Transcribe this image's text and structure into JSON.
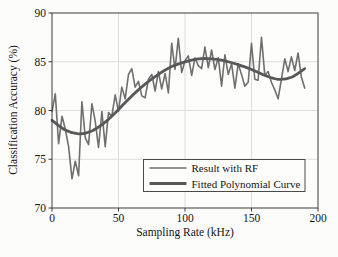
{
  "chart_data": {
    "type": "line",
    "title": "",
    "xlabel": "Sampling Rate (kHz)",
    "ylabel": "Classification Accuracy (%)",
    "xlim": [
      0,
      200
    ],
    "ylim": [
      70,
      90
    ],
    "x_ticks": [
      0,
      50,
      100,
      150,
      200
    ],
    "y_ticks": [
      70,
      75,
      80,
      85,
      90
    ],
    "grid": true,
    "legend_position": "inside lower right",
    "series": [
      {
        "name": "Result with RF",
        "color": "#6f6f6f",
        "stroke_width": 1.6,
        "smooth": false,
        "x": [
          0,
          2.5,
          5,
          7.5,
          10,
          12.5,
          15,
          17.5,
          20,
          22.5,
          25,
          27.5,
          30,
          32.5,
          35,
          37.5,
          40,
          42.5,
          45,
          47.5,
          50,
          52.5,
          55,
          57.5,
          60,
          62.5,
          65,
          67.5,
          70,
          72.5,
          75,
          77.5,
          80,
          82.5,
          85,
          87.5,
          90,
          92.5,
          95,
          97.5,
          100,
          102.5,
          105,
          107.5,
          110,
          112.5,
          115,
          117.5,
          120,
          122.5,
          125,
          127.5,
          130,
          132.5,
          135,
          137.5,
          140,
          142.5,
          145,
          147.5,
          150,
          152.5,
          155,
          157.5,
          160,
          162.5,
          165,
          167.5,
          170,
          172.5,
          175,
          177.5,
          180,
          182.5,
          185,
          187.5,
          190
        ],
        "values": [
          79.9,
          81.7,
          76.6,
          79.4,
          78.1,
          76.3,
          73.0,
          74.8,
          73.3,
          80.9,
          77.2,
          76.5,
          80.7,
          78.9,
          76.2,
          79.9,
          76.3,
          79.8,
          79.4,
          81.6,
          79.9,
          82.4,
          81.2,
          83.7,
          84.3,
          82.4,
          83.0,
          81.5,
          81.3,
          83.2,
          83.7,
          82.0,
          84.0,
          82.2,
          83.8,
          81.8,
          86.9,
          84.2,
          87.4,
          83.9,
          85.1,
          85.6,
          83.6,
          85.4,
          84.6,
          84.3,
          86.5,
          84.4,
          86.2,
          84.2,
          85.4,
          82.5,
          85.7,
          83.7,
          84.8,
          82.3,
          84.8,
          83.7,
          82.5,
          82.9,
          86.9,
          83.2,
          83.1,
          87.5,
          83.6,
          84.0,
          82.9,
          82.1,
          81.2,
          83.2,
          85.3,
          84.0,
          85.5,
          84.1,
          85.9,
          83.4,
          82.3
        ]
      },
      {
        "name": "Fitted Polynomial Curve",
        "color": "#585858",
        "stroke_width": 2.8,
        "smooth": true,
        "x": [
          0,
          10,
          20,
          30,
          40,
          50,
          60,
          70,
          80,
          90,
          100,
          110,
          120,
          130,
          140,
          150,
          160,
          170,
          180,
          190
        ],
        "values": [
          79.0,
          78.0,
          77.6,
          77.9,
          78.8,
          80.1,
          81.5,
          82.7,
          83.7,
          84.5,
          85.0,
          85.3,
          85.3,
          85.1,
          84.7,
          84.2,
          83.6,
          83.2,
          83.4,
          84.3
        ]
      }
    ],
    "colors": {
      "plot_background": "#fdfdfc",
      "grid": "#dddddd",
      "axis_box": "#3d3d3d",
      "text": "#141414",
      "legend_border": "#4a4a4a",
      "legend_background": "#fdfdfc"
    }
  }
}
